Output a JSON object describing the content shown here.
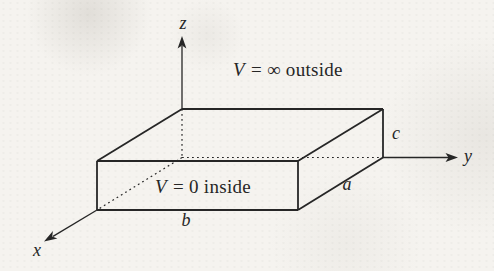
{
  "diagram": {
    "axes": {
      "x": "x",
      "y": "y",
      "z": "z"
    },
    "dimensions": {
      "a": "a",
      "b": "b",
      "c": "c"
    },
    "annotations": {
      "outside": {
        "variable": "V",
        "expression": "= ∞ outside"
      },
      "inside": {
        "variable": "V",
        "expression": "= 0 inside"
      }
    },
    "colors": {
      "line": "#262626",
      "paper": "#f5f3ef"
    }
  }
}
